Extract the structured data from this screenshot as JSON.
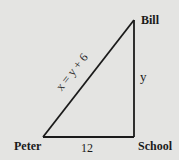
{
  "diagram": {
    "type": "right-triangle",
    "vertices": {
      "peter": {
        "label": "Peter"
      },
      "school": {
        "label": "School"
      },
      "bill": {
        "label": "Bill"
      }
    },
    "edges": {
      "base": {
        "label": "12",
        "from": "Peter",
        "to": "School"
      },
      "side": {
        "label": "y",
        "from": "School",
        "to": "Bill"
      },
      "hypotenuse": {
        "label": "x = y + 6",
        "from": "Peter",
        "to": "Bill"
      }
    },
    "colors": {
      "line": "#1a1a1a",
      "background": "#e4e4e2"
    }
  }
}
